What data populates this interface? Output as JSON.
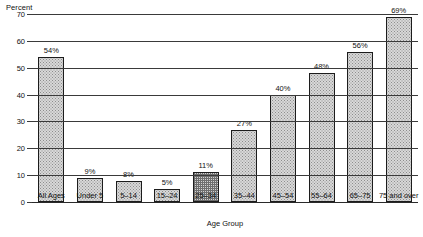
{
  "chart_data": {
    "type": "bar",
    "title": "",
    "subtitle": "",
    "ylabel": "Percent",
    "xlabel": "Age Group",
    "ylim": [
      0,
      70
    ],
    "ytick_step": 10,
    "yticks": [
      "0",
      "10",
      "20",
      "30",
      "40",
      "50",
      "60",
      "70"
    ],
    "grid": true,
    "legend": false,
    "categories": [
      "All Ages",
      "Under 5",
      "5–14",
      "15–24",
      "25–34",
      "35–44",
      "45–54",
      "55–64",
      "65–75",
      "75 and over"
    ],
    "values": [
      54,
      9,
      8,
      5,
      11,
      27,
      40,
      48,
      56,
      69
    ],
    "value_labels": [
      "54%",
      "9%",
      "8%",
      "5%",
      "11%",
      "27%",
      "40%",
      "48%",
      "56%",
      "69%"
    ],
    "bar_fill": "#d8d8d8",
    "bar_edge": "#1c1c1c",
    "grid_color": "#3a3a3a",
    "highlight_index": 4,
    "highlight_pattern": "crosshatch"
  }
}
